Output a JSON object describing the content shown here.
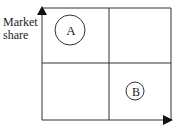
{
  "diagram": {
    "y_axis_label_line1": "Market",
    "y_axis_label_line2": "share",
    "circles": [
      {
        "label": "A",
        "quadrant": "top-left",
        "size": "large"
      },
      {
        "label": "B",
        "quadrant": "bottom-right",
        "size": "small"
      }
    ],
    "colors": {
      "stroke": "#333333",
      "background": "#ffffff"
    }
  }
}
